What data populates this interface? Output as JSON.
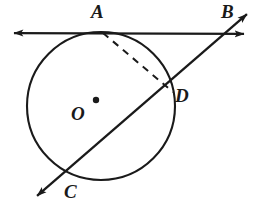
{
  "figure": {
    "background_color": "#ffffff",
    "stroke_color": "#1a1a1a",
    "width": 257,
    "height": 213
  },
  "labels": {
    "A": "A",
    "B": "B",
    "C": "C",
    "D": "D",
    "O": "O"
  },
  "geometry": {
    "circle": {
      "center_x": 101,
      "center_y": 106,
      "radius": 74,
      "stroke_width": 2.1
    },
    "center_dot": {
      "x": 96,
      "y": 100,
      "r": 3.2
    },
    "tangent_line": {
      "name": "line-AB",
      "x1": 6,
      "y1": 33,
      "x2": 252,
      "y2": 34,
      "stroke_width": 2.2,
      "arrows": "both"
    },
    "secant_line": {
      "name": "line-CB",
      "x1": 31,
      "y1": 201,
      "x2": 253,
      "y2": 9,
      "stroke_width": 2.3,
      "arrows": "both"
    },
    "chord_AD": {
      "name": "chord-A-D",
      "x1": 103,
      "y1": 33,
      "x2": 173,
      "y2": 92,
      "stroke_width": 2.0,
      "dash": "7 6"
    },
    "points": {
      "A": {
        "x": 103,
        "y": 33
      },
      "B": {
        "x": 233,
        "y": 31
      },
      "C": {
        "x": 68,
        "y": 170
      },
      "D": {
        "x": 173,
        "y": 92
      }
    }
  }
}
